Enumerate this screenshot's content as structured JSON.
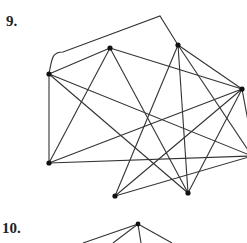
{
  "problems": [
    {
      "number_label": "9."
    },
    {
      "number_label": "10."
    }
  ],
  "graph9": {
    "vertices": [
      {
        "id": "A",
        "x": 49,
        "y": 74
      },
      {
        "id": "B",
        "x": 110,
        "y": 48
      },
      {
        "id": "C",
        "x": 178,
        "y": 45
      },
      {
        "id": "D",
        "x": 242,
        "y": 89
      },
      {
        "id": "E",
        "x": 49,
        "y": 163
      },
      {
        "id": "F",
        "x": 115,
        "y": 196
      },
      {
        "id": "G",
        "x": 188,
        "y": 193
      },
      {
        "id": "H",
        "x": 252,
        "y": 156
      }
    ],
    "edges": [
      [
        "A",
        "B"
      ],
      [
        "A",
        "E"
      ],
      [
        "A",
        "G"
      ],
      [
        "A",
        "H"
      ],
      [
        "B",
        "E"
      ],
      [
        "B",
        "G"
      ],
      [
        "B",
        "D"
      ],
      [
        "E",
        "D"
      ],
      [
        "E",
        "H"
      ],
      [
        "F",
        "C"
      ],
      [
        "F",
        "D"
      ],
      [
        "F",
        "H"
      ],
      [
        "C",
        "G"
      ],
      [
        "C",
        "D"
      ],
      [
        "C",
        "H"
      ],
      [
        "D",
        "G"
      ],
      [
        "D",
        "H2"
      ]
    ],
    "curved_edge": {
      "from": "A",
      "to": "C",
      "via": [
        [
          52,
          58
        ],
        [
          63,
          52
        ],
        [
          160,
          16
        ]
      ]
    },
    "stroke_color": "#333333",
    "vertex_color": "#111111"
  },
  "graph10": {
    "vertices": [
      {
        "id": "T",
        "x": 138,
        "y": 224
      }
    ],
    "partial_edges": [
      [
        138,
        224,
        83,
        243
      ],
      [
        138,
        224,
        113,
        243
      ],
      [
        138,
        224,
        141,
        243
      ],
      [
        138,
        224,
        172,
        243
      ]
    ]
  }
}
